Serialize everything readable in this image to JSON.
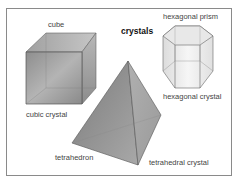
{
  "diagram": {
    "title": "crystals",
    "labels": {
      "cube": "cube",
      "cubic_crystal": "cubic crystal",
      "hexagonal_prism": "hexagonal prism",
      "hexagonal_crystal": "hexagonal crystal",
      "tetrahedron": "tetrahedron",
      "tetrahedral_crystal": "tetrahedral crystal"
    },
    "shapes": [
      "cube",
      "hexagonal prism",
      "tetrahedron"
    ],
    "colors": {
      "frame": "#8a8a8a",
      "crystal_fill": "#9a9a9a",
      "edge": "#555555"
    }
  }
}
